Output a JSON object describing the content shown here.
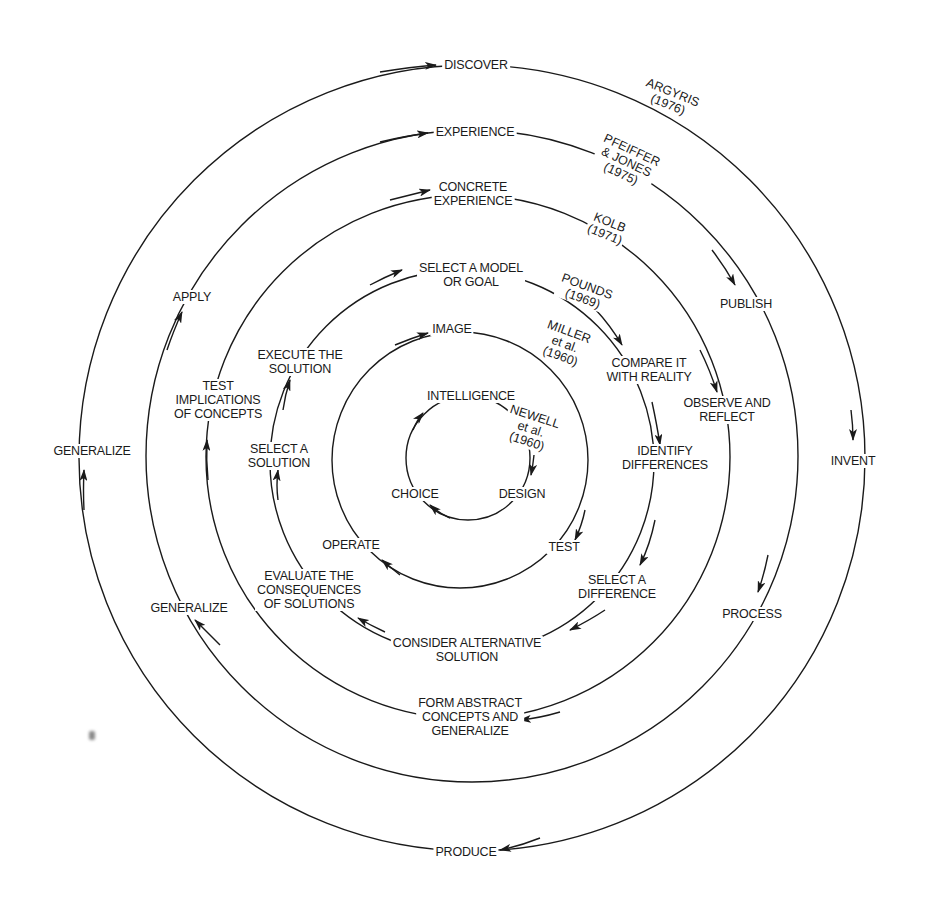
{
  "diagram": {
    "type": "concentric-cycle-models",
    "center": [
      472,
      458
    ],
    "ink_color": "#1a1a1a",
    "background": "#ffffff"
  },
  "rings": [
    {
      "id": "argyris",
      "author": "ARGYRIS\n(1976)",
      "radius": 393,
      "stages": [
        "DISCOVER",
        "INVENT",
        "PRODUCE",
        "GENERALIZE"
      ]
    },
    {
      "id": "pfeiffer-jones",
      "author": "PFEIFFER\n& JONES\n(1975)",
      "radius": 328,
      "stages": [
        "EXPERIENCE",
        "PUBLISH",
        "PROCESS",
        "GENERALIZE",
        "APPLY"
      ]
    },
    {
      "id": "kolb",
      "author": "KOLB\n(1971)",
      "radius": 264,
      "stages": [
        "CONCRETE\nEXPERIENCE",
        "OBSERVE AND\nREFLECT",
        "FORM ABSTRACT\nCONCEPTS AND\nGENERALIZE",
        "TEST\nIMPLICATIONS\nOF CONCEPTS"
      ]
    },
    {
      "id": "pounds",
      "author": "POUNDS\n(1969)",
      "radius": 192,
      "stages": [
        "SELECT A MODEL\nOR GOAL",
        "COMPARE IT\nWITH REALITY",
        "IDENTIFY\nDIFFERENCES",
        "SELECT A\nDIFFERENCE",
        "CONSIDER ALTERNATIVE\nSOLUTION",
        "EVALUATE THE\nCONSEQUENCES\nOF SOLUTIONS",
        "SELECT A\nSOLUTION",
        "EXECUTE THE\nSOLUTION"
      ]
    },
    {
      "id": "miller",
      "author": "MILLER\net al.\n(1960)",
      "radius": 130,
      "stages": [
        "IMAGE",
        "TEST",
        "OPERATE"
      ]
    },
    {
      "id": "newell",
      "author": "NEWELL\net al.\n(1960)",
      "radius": 64,
      "stages": [
        "INTELLIGENCE",
        "DESIGN",
        "CHOICE"
      ]
    }
  ],
  "labels": {
    "discover": "DISCOVER",
    "invent": "INVENT",
    "produce": "PRODUCE",
    "generalize_outer": "GENERALIZE",
    "experience": "EXPERIENCE",
    "publish": "PUBLISH",
    "process": "PROCESS",
    "generalize_2": "GENERALIZE",
    "apply": "APPLY",
    "concrete_experience": "CONCRETE\nEXPERIENCE",
    "observe_reflect": "OBSERVE AND\nREFLECT",
    "form_abstract": "FORM ABSTRACT\nCONCEPTS AND\nGENERALIZE",
    "test_implications": "TEST\nIMPLICATIONS\nOF CONCEPTS",
    "select_model": "SELECT A MODEL\nOR GOAL",
    "compare_reality": "COMPARE IT\nWITH REALITY",
    "identify_differences": "IDENTIFY\nDIFFERENCES",
    "select_difference": "SELECT A\nDIFFERENCE",
    "consider_alternative": "CONSIDER ALTERNATIVE\nSOLUTION",
    "evaluate_consequences": "EVALUATE THE\nCONSEQUENCES\nOF SOLUTIONS",
    "select_solution": "SELECT A\nSOLUTION",
    "execute_solution": "EXECUTE THE\nSOLUTION",
    "image": "IMAGE",
    "test": "TEST",
    "operate": "OPERATE",
    "intelligence": "INTELLIGENCE",
    "design": "DESIGN",
    "choice": "CHOICE"
  },
  "authors": {
    "argyris": "ARGYRIS\n(1976)",
    "pfeiffer": "PFEIFFER\n& JONES\n(1975)",
    "kolb": "KOLB\n(1971)",
    "pounds": "POUNDS\n(1969)",
    "miller": "MILLER\net al.\n(1960)",
    "newell": "NEWELL\net al.\n(1960)"
  }
}
